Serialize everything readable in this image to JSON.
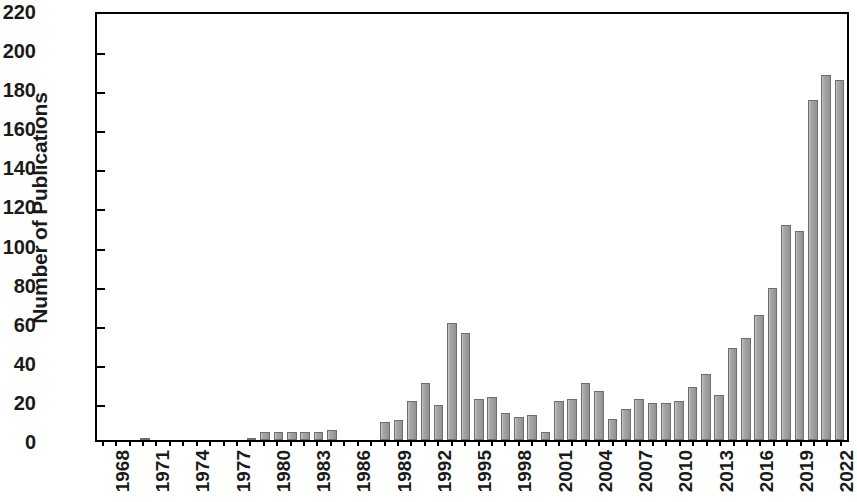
{
  "chart_data": {
    "type": "bar",
    "title": "",
    "xlabel": "",
    "ylabel": "Number of Publications",
    "ylim": [
      0,
      220
    ],
    "ytick_step": 20,
    "yticks": [
      0,
      20,
      40,
      60,
      80,
      100,
      120,
      140,
      160,
      180,
      200,
      220
    ],
    "ytick_labels": [
      "0",
      "20",
      "40",
      "60",
      "80",
      "100",
      "120",
      "140",
      "160",
      "180",
      "200",
      "220"
    ],
    "grid": false,
    "legend": null,
    "bar_color": "#a3a3a3",
    "bar_edge_color": "#6e6e6e",
    "xtick_interval_years": 3,
    "xtick_labels": [
      "1968",
      "1971",
      "1974",
      "1977",
      "1980",
      "1983",
      "1986",
      "1989",
      "1992",
      "1995",
      "1998",
      "2001",
      "2004",
      "2007",
      "2010",
      "2013",
      "2016",
      "2019",
      "2022"
    ],
    "categories": [
      "1968",
      "1969",
      "1970",
      "1971",
      "1972",
      "1973",
      "1974",
      "1975",
      "1976",
      "1977",
      "1978",
      "1979",
      "1980",
      "1981",
      "1982",
      "1983",
      "1984",
      "1985",
      "1986",
      "1987",
      "1988",
      "1989",
      "1990",
      "1991",
      "1992",
      "1993",
      "1994",
      "1995",
      "1996",
      "1997",
      "1998",
      "1999",
      "2000",
      "2001",
      "2002",
      "2003",
      "2004",
      "2005",
      "2006",
      "2007",
      "2008",
      "2009",
      "2010",
      "2011",
      "2012",
      "2013",
      "2014",
      "2015",
      "2016",
      "2017",
      "2018",
      "2019",
      "2020",
      "2021",
      "2022",
      "2023"
    ],
    "values": [
      0,
      0,
      0,
      1,
      0,
      0,
      0,
      0,
      0,
      0,
      0,
      1,
      4,
      4,
      4,
      4,
      4,
      5,
      0,
      0,
      0,
      9,
      10,
      20,
      29,
      18,
      60,
      55,
      21,
      22,
      14,
      12,
      13,
      4,
      20,
      21,
      29,
      25,
      11,
      16,
      21,
      19,
      19,
      20,
      27,
      34,
      23,
      47,
      52,
      64,
      78,
      110,
      107,
      174,
      187,
      184
    ]
  }
}
